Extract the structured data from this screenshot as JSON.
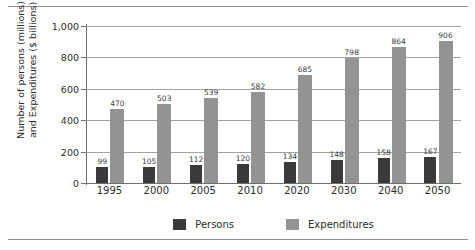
{
  "page": {
    "rule_color": "#8f8f8f"
  },
  "chart_data": {
    "type": "bar",
    "title": "",
    "xlabel": "",
    "ylabel": "Number of persons (millions) and Expenditures ($ billions)",
    "ylabel_line1": "Number of persons (millions)",
    "ylabel_line2": "and Expenditures ($ billions)",
    "ylim": [
      0,
      1000
    ],
    "ytick_labels": [
      "0",
      "200",
      "400",
      "600",
      "800",
      "1,000"
    ],
    "ytick_values": [
      0,
      200,
      400,
      600,
      800,
      1000
    ],
    "grid": true,
    "grid_axis": "y",
    "legend_position": "bottom-center",
    "categories": [
      "1995",
      "2000",
      "2005",
      "2010",
      "2020",
      "2030",
      "2040",
      "2050"
    ],
    "series": [
      {
        "name": "Persons",
        "color": "#3a3a3a",
        "values": [
          99,
          105,
          112,
          120,
          134,
          148,
          158,
          167
        ]
      },
      {
        "name": "Expenditures",
        "color": "#939393",
        "values": [
          470,
          503,
          539,
          582,
          685,
          798,
          864,
          906
        ]
      }
    ]
  },
  "legend": {
    "items": [
      {
        "label": "Persons",
        "color": "#3a3a3a"
      },
      {
        "label": "Expenditures",
        "color": "#939393"
      }
    ]
  }
}
